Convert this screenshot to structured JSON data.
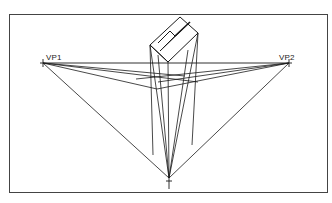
{
  "diagram": {
    "type": "three-point perspective construction",
    "labels": {
      "vp1": "VP1",
      "vp2": "VP2"
    },
    "colors": {
      "line": "#1a1a1a",
      "frame": "#333333",
      "background": "#ffffff"
    },
    "points": {
      "vp1": [
        43,
        63
      ],
      "vp2": [
        289,
        63
      ],
      "vp3": [
        169,
        178
      ]
    }
  }
}
